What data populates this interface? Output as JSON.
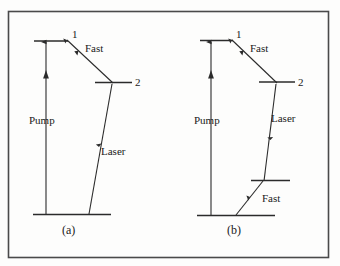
{
  "figure": {
    "background_color": "#fdfdfc",
    "frame_color": "#4a4a4a",
    "line_color": "#2b2b2b",
    "text_color": "#1a1a1a",
    "panels": [
      {
        "id": "panel-a",
        "caption": "(a)",
        "scheme": "three-level",
        "levels": [
          {
            "name": "ground",
            "label": ""
          },
          {
            "name": "upper-pump-level",
            "label": "1"
          },
          {
            "name": "upper-laser-level",
            "label": "2"
          }
        ],
        "transitions": [
          {
            "name": "pump",
            "label": "Pump",
            "direction": "up"
          },
          {
            "name": "fast-decay",
            "label": "Fast",
            "direction": "down"
          },
          {
            "name": "laser",
            "label": "Laser",
            "direction": "down"
          }
        ]
      },
      {
        "id": "panel-b",
        "caption": "(b)",
        "scheme": "four-level",
        "levels": [
          {
            "name": "ground",
            "label": ""
          },
          {
            "name": "upper-pump-level",
            "label": "1"
          },
          {
            "name": "upper-laser-level",
            "label": "2"
          },
          {
            "name": "lower-laser-level",
            "label": ""
          }
        ],
        "transitions": [
          {
            "name": "pump",
            "label": "Pump",
            "direction": "up"
          },
          {
            "name": "fast-decay-upper",
            "label": "Fast",
            "direction": "down"
          },
          {
            "name": "laser",
            "label": "Laser",
            "direction": "down"
          },
          {
            "name": "fast-decay-lower",
            "label": "Fast",
            "direction": "down"
          }
        ]
      }
    ]
  }
}
